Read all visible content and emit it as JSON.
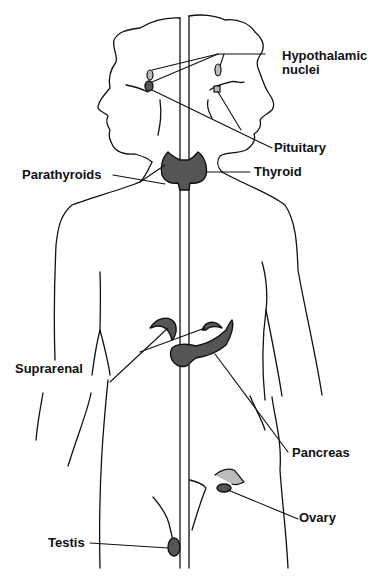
{
  "figure": {
    "type": "anatomical-diagram",
    "labels": [
      {
        "id": "hypothalamic",
        "text_line1": "Hypothalamic",
        "text_line2": "nuclei"
      },
      {
        "id": "pituitary",
        "text": "Pituitary"
      },
      {
        "id": "thyroid",
        "text": "Thyroid"
      },
      {
        "id": "parathyroids",
        "text": "Parathyroids"
      },
      {
        "id": "suprarenal",
        "text": "Suprarenal"
      },
      {
        "id": "pancreas",
        "text": "Pancreas"
      },
      {
        "id": "ovary",
        "text": "Ovary"
      },
      {
        "id": "testis",
        "text": "Testis"
      }
    ],
    "colors": {
      "line": "#111111",
      "background": "#ffffff",
      "gland_fill": "#555555"
    }
  }
}
